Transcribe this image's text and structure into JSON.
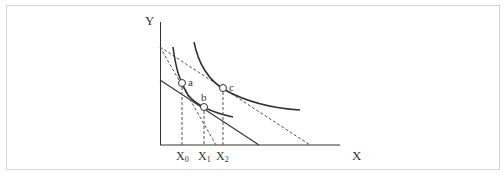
{
  "diagram": {
    "type": "indifference-curve-budget-line",
    "axes": {
      "y_label": "Y",
      "x_label": "X"
    },
    "points": [
      {
        "id": "a",
        "label": "a"
      },
      {
        "id": "b",
        "label": "b"
      },
      {
        "id": "c",
        "label": "c"
      }
    ],
    "x_ticks": [
      {
        "label": "X",
        "sub": "0"
      },
      {
        "label": "X",
        "sub": "1"
      },
      {
        "label": "X",
        "sub": "2"
      }
    ],
    "colors": {
      "line": "#333333",
      "dashed": "#555555",
      "frame": "#d4d4d4"
    }
  }
}
